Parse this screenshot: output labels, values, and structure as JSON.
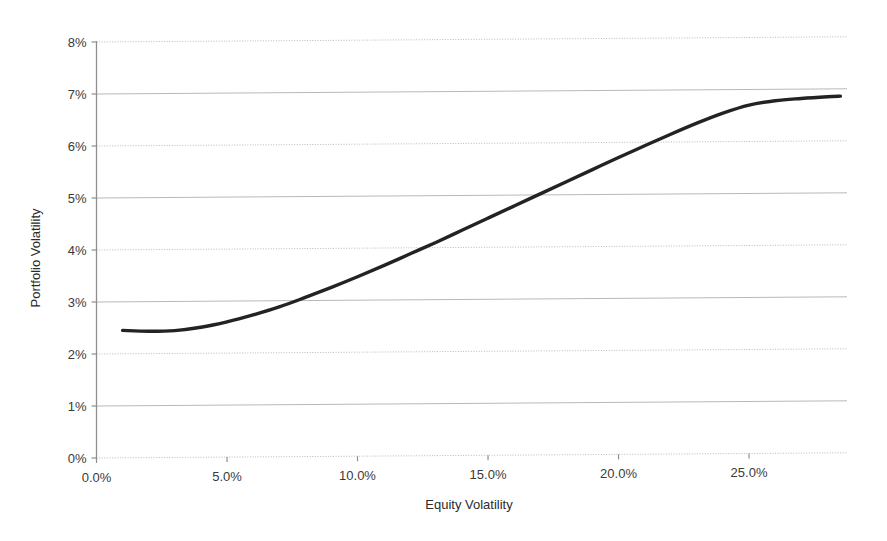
{
  "chart_data": {
    "type": "line",
    "title": "",
    "xlabel": "Equity Volatility",
    "ylabel": "Portfolio Volatility",
    "xlim": [
      0.0,
      28.6
    ],
    "ylim": [
      0.0,
      8.0
    ],
    "grid": true,
    "legend": null,
    "x_tick_labels": [
      "0.0%",
      "5.0%",
      "10.0%",
      "15.0%",
      "20.0%",
      "25.0%"
    ],
    "x_tick_values": [
      0.0,
      5.0,
      10.0,
      15.0,
      20.0,
      25.0
    ],
    "y_tick_labels": [
      "0%",
      "1%",
      "2%",
      "3%",
      "4%",
      "5%",
      "6%",
      "7%",
      "8%"
    ],
    "y_tick_values": [
      0,
      1,
      2,
      3,
      4,
      5,
      6,
      7,
      8
    ],
    "series": [
      {
        "name": "Portfolio Volatility",
        "color": "#232323",
        "x": [
          1.0,
          2.0,
          3.0,
          4.0,
          5.0,
          6.0,
          7.0,
          8.0,
          9.0,
          10.0,
          11.0,
          12.0,
          13.0,
          14.0,
          15.0,
          16.0,
          17.0,
          18.0,
          19.0,
          20.0,
          21.0,
          22.0,
          23.0,
          24.0,
          25.0,
          26.0,
          27.0,
          28.0,
          28.5
        ],
        "y": [
          2.45,
          2.43,
          2.44,
          2.5,
          2.6,
          2.73,
          2.88,
          3.06,
          3.25,
          3.45,
          3.66,
          3.88,
          4.1,
          4.33,
          4.56,
          4.79,
          5.02,
          5.25,
          5.48,
          5.71,
          5.93,
          6.15,
          6.36,
          6.55,
          6.7,
          6.78,
          6.82,
          6.85,
          6.86
        ]
      }
    ],
    "annotations": []
  },
  "axes": {
    "y_title": "Portfolio Volatility",
    "x_title": "Equity Volatility"
  }
}
